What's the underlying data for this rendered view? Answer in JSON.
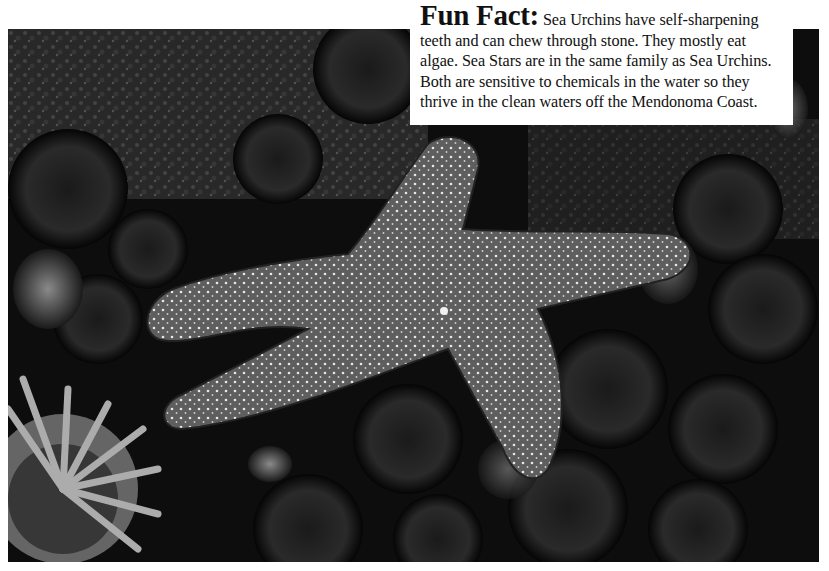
{
  "photo": {
    "subject": "sea-star-among-sea-urchins-and-anemone",
    "tone": "grayscale"
  },
  "fact_box": {
    "heading": "Fun Fact:",
    "body": " Sea Urchins have self-sharpening teeth and can chew through stone. They mostly eat algae. Sea Stars are in the same family as Sea Urchins. Both are sensitive to chemicals in the water so they thrive in the clean waters off the Mendonoma Coast."
  },
  "colors": {
    "background": "#ffffff",
    "photo_dark": "#0d0d0d",
    "text": "#111111"
  }
}
